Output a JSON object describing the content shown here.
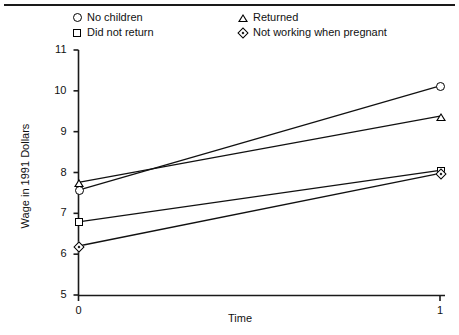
{
  "chart_data": {
    "type": "line",
    "title": "",
    "xlabel": "Time",
    "ylabel": "Wage in 1991 Dollars",
    "x": [
      0,
      1
    ],
    "xticks": [
      "0",
      "1"
    ],
    "xlim": [
      0,
      1
    ],
    "yticks": [
      "5",
      "6",
      "7",
      "8",
      "9",
      "10",
      "11"
    ],
    "ylim": [
      5,
      11
    ],
    "grid": false,
    "legend_position": "top",
    "series": [
      {
        "name": "No children",
        "marker": "circle",
        "values": [
          7.57,
          10.12
        ]
      },
      {
        "name": "Did not return",
        "marker": "square",
        "values": [
          6.79,
          8.05
        ]
      },
      {
        "name": "Returned",
        "marker": "triangle",
        "values": [
          7.76,
          9.38
        ]
      },
      {
        "name": "Not working when pregnant",
        "marker": "diamond",
        "values": [
          6.2,
          7.98
        ]
      }
    ]
  },
  "legend": {
    "items": [
      {
        "label": "No children",
        "marker": "circle"
      },
      {
        "label": "Did not return",
        "marker": "square"
      },
      {
        "label": "Returned",
        "marker": "triangle"
      },
      {
        "label": "Not working when pregnant",
        "marker": "diamond"
      }
    ]
  },
  "axes": {
    "y_label": "Wage in 1991 Dollars",
    "x_label": "Time",
    "y_tick_labels": [
      "11",
      "10",
      "9",
      "8",
      "7",
      "6",
      "5"
    ],
    "x_tick_labels": [
      "0",
      "1"
    ]
  },
  "colors": {
    "ink": "#111111",
    "axis": "#1a1a1a",
    "background": "#ffffff"
  }
}
